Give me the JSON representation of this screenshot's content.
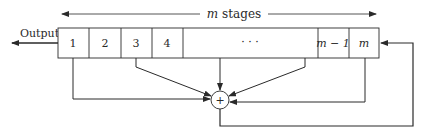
{
  "diagram": {
    "type": "shift-register-with-feedback",
    "span_label_var": "m",
    "span_label_text": " stages",
    "output_label": "Output",
    "cells": [
      {
        "label": "1",
        "italic": false
      },
      {
        "label": "2",
        "italic": false
      },
      {
        "label": "3",
        "italic": false
      },
      {
        "label": "4",
        "italic": false
      },
      {
        "label": "· · ·",
        "italic": false
      },
      {
        "label": "m − 1",
        "italic": true
      },
      {
        "label": "m",
        "italic": true
      }
    ],
    "adder_symbol": "+",
    "taps_from_cells": [
      "1",
      "3",
      "· · ·",
      "m"
    ],
    "feedback_into_cell": "m",
    "colors": {
      "line": "#2a2a2a",
      "background": "#ffffff"
    }
  }
}
